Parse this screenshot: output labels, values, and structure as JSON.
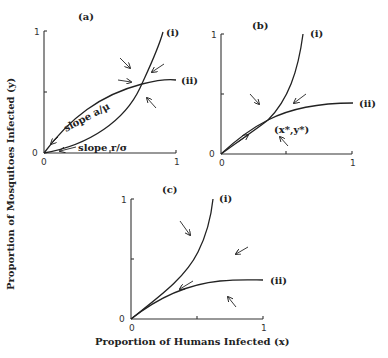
{
  "figure": {
    "y_axis_label": "Proportion of Mosquitoes Infected (y)",
    "x_axis_label": "Proportion of Humans Infected (x)",
    "panels": [
      {
        "id": "a",
        "label": "(a)",
        "tick_zero_x": "0",
        "tick_one_x": "1",
        "tick_zero_y": "0",
        "tick_one_y": "1",
        "curve_i_label": "(i)",
        "curve_ii_label": "(ii)",
        "annotation_slope_a": "slope a/μ",
        "annotation_slope_r": "slope r/σ"
      },
      {
        "id": "b",
        "label": "(b)",
        "tick_zero_x": "0",
        "tick_one_x": "1",
        "tick_zero_y": "0",
        "tick_one_y": "1",
        "curve_i_label": "(i)",
        "curve_ii_label": "(ii)",
        "equilibrium_label": "(x*,y*)"
      },
      {
        "id": "c",
        "label": "(c)",
        "tick_zero_x": "0",
        "tick_one_x": "1",
        "tick_zero_y": "0",
        "tick_one_y": "1",
        "curve_i_label": "(i)",
        "curve_ii_label": "(ii)"
      }
    ]
  }
}
